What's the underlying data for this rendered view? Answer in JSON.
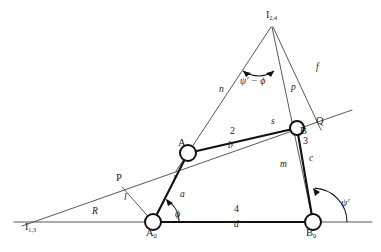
{
  "figure": {
    "type": "four-bar-linkage-kinematic-diagram",
    "background": "#ffffff",
    "line_color": "#1a1a1a",
    "label_color": "#1a1a1a",
    "width": 381,
    "height": 252
  },
  "joints": [
    {
      "id": "A0",
      "label": "A",
      "subscript": "0",
      "x": 153,
      "y": 222,
      "r": 8
    },
    {
      "id": "A",
      "label": "A",
      "subscript": "",
      "x": 188,
      "y": 153,
      "r": 8
    },
    {
      "id": "B",
      "label": "B",
      "subscript": "",
      "x": 297,
      "y": 128,
      "r": 7
    },
    {
      "id": "B0",
      "label": "B",
      "subscript": "0",
      "x": 313,
      "y": 222,
      "r": 8
    }
  ],
  "instant_centers": [
    {
      "id": "I13",
      "label": "I",
      "subscript": "1,3",
      "x": 30,
      "y": 224
    },
    {
      "id": "I24",
      "label": "I",
      "subscript": "2,4",
      "x": 272,
      "y": 18
    }
  ],
  "auxiliary_points": [
    {
      "id": "P",
      "label": "P",
      "x": 122,
      "y": 180
    },
    {
      "id": "Q",
      "label": "Q",
      "x": 313,
      "y": 124
    },
    {
      "id": "S",
      "label": "s",
      "x": 275,
      "y": 123
    }
  ],
  "link_numbers": [
    {
      "label": "2",
      "x": 233,
      "y": 133
    },
    {
      "label": "3",
      "x": 306,
      "y": 143
    },
    {
      "label": "4",
      "x": 237,
      "y": 211
    }
  ],
  "link_lengths": [
    {
      "label": "b",
      "x": 231,
      "y": 147
    },
    {
      "label": "c",
      "x": 311,
      "y": 160
    },
    {
      "label": "d",
      "x": 237,
      "y": 226
    },
    {
      "label": "R",
      "x": 95,
      "y": 214
    }
  ],
  "ray_labels": [
    {
      "label": "n",
      "x": 222,
      "y": 91
    },
    {
      "label": "f",
      "x": 318,
      "y": 69
    },
    {
      "label": "p",
      "x": 294,
      "y": 89
    },
    {
      "label": "m",
      "x": 283,
      "y": 166
    },
    {
      "label": "l",
      "x": 126,
      "y": 199
    },
    {
      "label": "l",
      "x": 175,
      "y": 181
    },
    {
      "label": "a",
      "x": 182,
      "y": 196
    }
  ],
  "angles": [
    {
      "id": "phi",
      "label": "ϕ",
      "x": 178,
      "y": 215,
      "vertex": "A0"
    },
    {
      "id": "psiprime",
      "label": "ψ′",
      "x": 345,
      "y": 204,
      "vertex": "B0"
    },
    {
      "id": "psi-phi",
      "label": "ψ′ − ϕ",
      "x": 248,
      "y": 79,
      "vertex": "I24"
    }
  ]
}
